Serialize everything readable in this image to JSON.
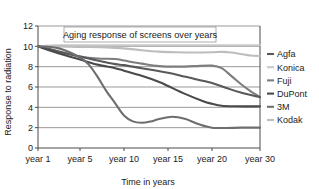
{
  "chart_data": {
    "type": "line",
    "title": "Aging response of screens over years",
    "xlabel": "Time in years",
    "ylabel": "Response to radiation",
    "ylim": [
      0,
      12
    ],
    "ytick_values": [
      0,
      2,
      4,
      6,
      8,
      10,
      12
    ],
    "ytick_labels": [
      "0",
      "2",
      "4",
      "6",
      "8",
      "10",
      "12"
    ],
    "xtick_labels": [
      "year 1",
      "year 5",
      "year 10",
      "year 15",
      "year 20",
      "year 30"
    ],
    "x": [
      1,
      5,
      10,
      15,
      20,
      30
    ],
    "grid": true,
    "legend_position": "right",
    "series": [
      {
        "name": "Agfa",
        "color": "#58585a",
        "values": [
          10.0,
          9.0,
          8.2,
          7.4,
          6.4,
          5.0
        ],
        "points": [
          [
            1,
            10.0
          ],
          [
            3,
            9.5
          ],
          [
            5,
            9.0
          ],
          [
            7,
            8.6
          ],
          [
            9,
            8.25
          ],
          [
            10,
            8.15
          ],
          [
            12,
            7.85
          ],
          [
            15,
            7.4
          ],
          [
            17,
            7.0
          ],
          [
            20,
            6.4
          ],
          [
            23,
            5.9
          ],
          [
            26,
            5.45
          ],
          [
            30,
            5.0
          ]
        ]
      },
      {
        "name": "Konica",
        "color": "#c9c9c9",
        "values": [
          10.0,
          10.1,
          10.1,
          10.1,
          10.1,
          10.1
        ],
        "points": [
          [
            1,
            10.0
          ],
          [
            3,
            10.1
          ],
          [
            6,
            10.1
          ],
          [
            10,
            10.1
          ],
          [
            15,
            10.1
          ],
          [
            20,
            10.1
          ],
          [
            25,
            10.1
          ],
          [
            30,
            10.1
          ]
        ]
      },
      {
        "name": "Fuji",
        "color": "#7d7d80",
        "values": [
          10.0,
          9.0,
          8.6,
          8.0,
          8.0,
          5.0
        ],
        "points": [
          [
            1,
            10.0
          ],
          [
            3,
            9.45
          ],
          [
            5,
            9.0
          ],
          [
            7,
            8.8
          ],
          [
            9,
            8.75
          ],
          [
            10,
            8.6
          ],
          [
            12,
            8.3
          ],
          [
            14,
            8.05
          ],
          [
            16,
            8.0
          ],
          [
            18,
            8.05
          ],
          [
            20,
            8.1
          ],
          [
            22,
            7.85
          ],
          [
            24,
            7.1
          ],
          [
            26,
            6.3
          ],
          [
            28,
            5.6
          ],
          [
            30,
            5.0
          ]
        ]
      },
      {
        "name": "DuPont",
        "color": "#4a4a4c",
        "values": [
          10.0,
          8.7,
          7.6,
          6.1,
          4.3,
          4.1
        ],
        "points": [
          [
            1,
            10.0
          ],
          [
            3,
            9.3
          ],
          [
            5,
            8.7
          ],
          [
            7,
            8.2
          ],
          [
            9,
            7.85
          ],
          [
            10,
            7.6
          ],
          [
            12,
            7.1
          ],
          [
            14,
            6.5
          ],
          [
            15,
            6.1
          ],
          [
            17,
            5.3
          ],
          [
            19,
            4.6
          ],
          [
            20,
            4.35
          ],
          [
            22,
            4.15
          ],
          [
            25,
            4.1
          ],
          [
            30,
            4.1
          ]
        ]
      },
      {
        "name": "3M",
        "color": "#6e6e70",
        "values": [
          10.0,
          8.9,
          3.2,
          3.05,
          2.0,
          2.0
        ],
        "points": [
          [
            1,
            10.0
          ],
          [
            3,
            9.8
          ],
          [
            5,
            8.9
          ],
          [
            6,
            8.2
          ],
          [
            7,
            7.0
          ],
          [
            8,
            5.6
          ],
          [
            9,
            4.4
          ],
          [
            10,
            3.2
          ],
          [
            11,
            2.62
          ],
          [
            12,
            2.48
          ],
          [
            13,
            2.6
          ],
          [
            14,
            2.85
          ],
          [
            15.5,
            3.08
          ],
          [
            17,
            2.85
          ],
          [
            18,
            2.5
          ],
          [
            19,
            2.2
          ],
          [
            20,
            2.0
          ],
          [
            23,
            1.97
          ],
          [
            26,
            2.0
          ],
          [
            30,
            2.0
          ]
        ]
      },
      {
        "name": "Kodak",
        "color": "#bdbdbd",
        "values": [
          10.0,
          9.95,
          9.8,
          9.45,
          9.4,
          9.05
        ],
        "points": [
          [
            1,
            10.0
          ],
          [
            3,
            10.0
          ],
          [
            5,
            9.95
          ],
          [
            8,
            9.9
          ],
          [
            10,
            9.8
          ],
          [
            12,
            9.62
          ],
          [
            14,
            9.48
          ],
          [
            16,
            9.42
          ],
          [
            18,
            9.4
          ],
          [
            20,
            9.42
          ],
          [
            22,
            9.45
          ],
          [
            24,
            9.4
          ],
          [
            26,
            9.25
          ],
          [
            28,
            9.1
          ],
          [
            30,
            9.05
          ]
        ]
      }
    ]
  }
}
